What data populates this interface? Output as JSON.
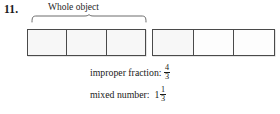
{
  "problem": {
    "number": "11.",
    "whole_object_label": "Whole object"
  },
  "diagram": {
    "strips": [
      {
        "name": "first-whole-strip",
        "cells": 3,
        "shaded_cells": 3
      },
      {
        "name": "second-partial-strip",
        "cells": 3,
        "shaded_cells": 1
      }
    ]
  },
  "answers": {
    "improper": {
      "label": "improper fraction:",
      "numerator": "4",
      "denominator": "3"
    },
    "mixed": {
      "label": "mixed number:",
      "whole": "1",
      "numerator": "1",
      "denominator": "3"
    }
  },
  "colors": {
    "ink": "#1a1a1a",
    "stroke": "#4a4a4a",
    "page": "#ffffff"
  }
}
